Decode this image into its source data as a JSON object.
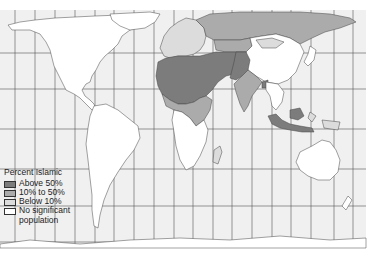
{
  "map": {
    "type": "choropleth world map",
    "projection": "Mercator-like with graticule",
    "background_color": "#f0f0f0",
    "grid_color": "#555555"
  },
  "legend": {
    "title": "Percent Islamic",
    "items": [
      {
        "label": "Above 50%",
        "color": "#7c7c7c"
      },
      {
        "label": "10% to 50%",
        "color": "#ababab"
      },
      {
        "label": "Below 10%",
        "color": "#dcdcdc"
      },
      {
        "label": "No significant",
        "label_line2": "population",
        "color": "#ffffff"
      }
    ]
  },
  "regions": {
    "above_50": [
      "North Africa",
      "Middle East",
      "Central Asia",
      "Pakistan",
      "Bangladesh",
      "Indonesia",
      "Malaysia"
    ],
    "between_10_50": [
      "Russia",
      "India",
      "East Africa",
      "West Africa (coastal)",
      "Kazakhstan"
    ],
    "below_10": [
      "Europe",
      "China (western)",
      "Mongolia",
      "Southeast Asia (parts)"
    ],
    "none": [
      "Americas",
      "Southern Africa",
      "Australia",
      "East Asia"
    ]
  }
}
